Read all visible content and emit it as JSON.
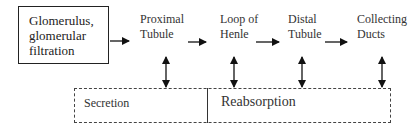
{
  "diagram": {
    "start_box": {
      "label": "Glomerulus,\nglomerular\nfiltration"
    },
    "stages": [
      {
        "label": "Proximal\nTubule"
      },
      {
        "label": "Loop of\nHenle"
      },
      {
        "label": "Distal\nTubule"
      },
      {
        "label": "Collecting\nDucts"
      }
    ],
    "regions": [
      {
        "label": "Secretion"
      },
      {
        "label": "Reabsorption"
      }
    ],
    "colors": {
      "line": "#222222",
      "background": "#ffffff"
    }
  }
}
